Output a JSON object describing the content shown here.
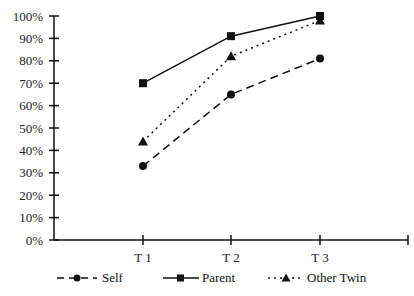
{
  "chart_data": {
    "type": "line",
    "title": "",
    "xlabel": "",
    "ylabel": "",
    "categories": [
      "T 1",
      "T 2",
      "T 3"
    ],
    "ylim": [
      0,
      100
    ],
    "yticks": [
      "0%",
      "10%",
      "20%",
      "30%",
      "40%",
      "50%",
      "60%",
      "70%",
      "80%",
      "90%",
      "100%"
    ],
    "grid": false,
    "legend_position": "bottom",
    "series": [
      {
        "name": "Self",
        "marker": "circle",
        "line": "dashed",
        "values": [
          33,
          65,
          81
        ]
      },
      {
        "name": "Parent",
        "marker": "square",
        "line": "solid",
        "values": [
          70,
          91,
          100
        ]
      },
      {
        "name": "Other Twin",
        "marker": "triangle",
        "line": "dotted",
        "values": [
          44,
          82,
          98
        ]
      }
    ]
  },
  "legend": {
    "self": "Self",
    "parent": "Parent",
    "other_twin": "Other Twin"
  }
}
